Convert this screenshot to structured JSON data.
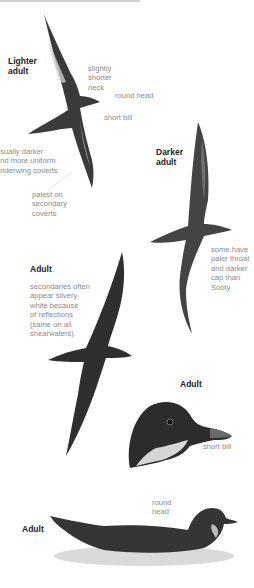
{
  "figure": {
    "colors": {
      "background": "#ffffff",
      "label": "#222222",
      "note": "#8a8a8a",
      "bird_dark": "#2e2e2e",
      "bird_mid": "#5a5a5a",
      "bird_light": "#c9c9c9",
      "water": "#d8d8d8"
    }
  },
  "panels": [
    {
      "title": "Lighter\nadult",
      "notes": [
        "slightly\nshorter\nneck",
        "round head",
        "short bill",
        "usually darker\nand more uniform\nunderwing coverts",
        "palest on\nsecondary\ncoverts"
      ]
    },
    {
      "title": "Darker\nadult",
      "notes": [
        "some have\npaler throat\nand darker\ncap than\nSooty"
      ]
    },
    {
      "title": "Adult",
      "notes": [
        "secondaries often\nappear silvery\nwhite because\nof reflections\n(same on all\nshearwaters)"
      ]
    },
    {
      "title": "Adult",
      "notes": [
        "short bill"
      ]
    },
    {
      "title": "Adult",
      "notes": [
        "round\nhead"
      ]
    }
  ]
}
